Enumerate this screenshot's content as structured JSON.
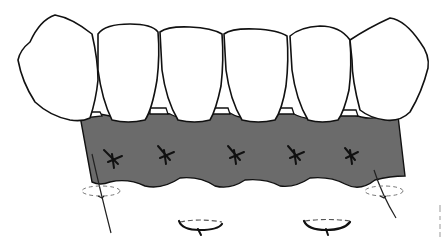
{
  "figure": {
    "type": "dental-illustration",
    "teeth_count": 6,
    "sutures_interdental_count": 5,
    "vertical_mattress_sutures_count": 4,
    "colors": {
      "background": "#ffffff",
      "outline": "#111111",
      "gingiva_fill": "#6b6b6b",
      "dashed_thread": "#777777"
    }
  }
}
